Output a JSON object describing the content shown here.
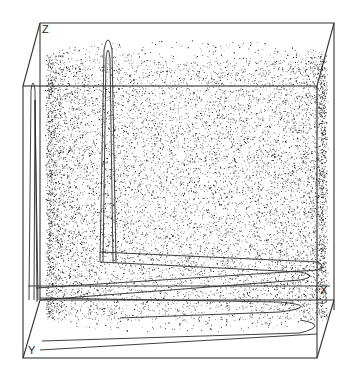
{
  "chart_data": {
    "type": "scatter",
    "subtype": "3d-point-cloud",
    "title": "",
    "axes": {
      "x_label": "X",
      "y_label": "Y",
      "z_label": "Z"
    },
    "ticks": {
      "x": [],
      "y": [],
      "z": []
    },
    "grid": false,
    "legend": null,
    "point_color": "#1a1a1a",
    "line_color": "#2a2a2a",
    "cloud": {
      "shape": "cylinder-shell",
      "approx_point_count": 9000,
      "x_range": [
        0,
        1
      ],
      "y_range": [
        0,
        1
      ],
      "z_range": [
        0,
        1
      ]
    },
    "trajectories": [
      {
        "name": "spike-left",
        "peak_z": 0.78
      },
      {
        "name": "spike-center",
        "peak_z": 0.95
      },
      {
        "name": "base-loops",
        "peak_z": 0.1
      }
    ]
  },
  "labels": {
    "x": "X",
    "y": "Y",
    "z": "Z"
  }
}
